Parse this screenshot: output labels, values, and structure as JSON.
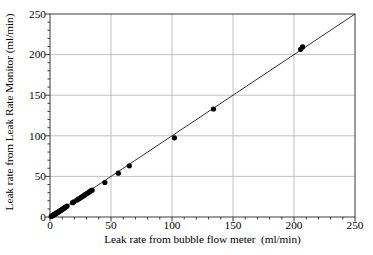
{
  "chart_data": {
    "type": "scatter",
    "title": "",
    "xlabel": "Leak rate from bubble flow meter  (ml/min)",
    "ylabel": "Leak rate from Leak Rate Monitor (ml/min)",
    "xlim": [
      0,
      250
    ],
    "ylim": [
      0,
      250
    ],
    "xticks": [
      0,
      50,
      100,
      150,
      200,
      250
    ],
    "yticks": [
      0,
      50,
      100,
      150,
      200,
      250
    ],
    "minor_tick_interval": 10,
    "grid": true,
    "grid_color": "#a8a8a8",
    "legend": "none",
    "marker": {
      "shape": "circle",
      "color": "#000000",
      "size": 5.2
    },
    "reference_line": {
      "name": "identity-line",
      "from": [
        0,
        0
      ],
      "to": [
        250,
        250
      ],
      "slope": 1,
      "intercept": 0,
      "color": "#1a1a1a",
      "width": 0.9
    },
    "series": [
      {
        "name": "Leak rate measurements",
        "points": [
          [
            1.0,
            0.8
          ],
          [
            1.5,
            1.2
          ],
          [
            2.0,
            1.6
          ],
          [
            2.4,
            2.0
          ],
          [
            2.8,
            2.4
          ],
          [
            3.2,
            2.8
          ],
          [
            3.6,
            3.2
          ],
          [
            4.0,
            3.6
          ],
          [
            4.5,
            4.0
          ],
          [
            5.0,
            4.4
          ],
          [
            5.5,
            4.9
          ],
          [
            6.0,
            5.4
          ],
          [
            6.5,
            5.9
          ],
          [
            7.0,
            6.4
          ],
          [
            7.5,
            6.9
          ],
          [
            8.0,
            7.4
          ],
          [
            8.6,
            8.0
          ],
          [
            9.2,
            8.6
          ],
          [
            9.8,
            9.2
          ],
          [
            10.4,
            9.8
          ],
          [
            11.0,
            10.4
          ],
          [
            11.6,
            11.0
          ],
          [
            12.2,
            11.6
          ],
          [
            12.8,
            12.2
          ],
          [
            13.4,
            12.8
          ],
          [
            14.0,
            13.4
          ],
          [
            18.5,
            17.6
          ],
          [
            19.5,
            18.6
          ],
          [
            22.0,
            20.8
          ],
          [
            23.0,
            21.8
          ],
          [
            24.0,
            22.8
          ],
          [
            25.5,
            24.2
          ],
          [
            26.5,
            25.2
          ],
          [
            27.5,
            26.2
          ],
          [
            28.5,
            27.2
          ],
          [
            29.5,
            28.2
          ],
          [
            30.5,
            29.2
          ],
          [
            31.5,
            30.2
          ],
          [
            32.5,
            31.2
          ],
          [
            33.5,
            32.2
          ],
          [
            34.5,
            33.0
          ],
          [
            45.0,
            42.5
          ],
          [
            56.0,
            54.0
          ],
          [
            65.0,
            63.0
          ],
          [
            102.0,
            97.5
          ],
          [
            134.0,
            133.0
          ],
          [
            205.5,
            206.5
          ],
          [
            207.0,
            209.5
          ]
        ]
      }
    ]
  },
  "axis": {
    "x_tick_labels": [
      "0",
      "50",
      "100",
      "150",
      "200",
      "250"
    ],
    "y_tick_labels": [
      "0",
      "50",
      "100",
      "150",
      "200",
      "250"
    ]
  }
}
